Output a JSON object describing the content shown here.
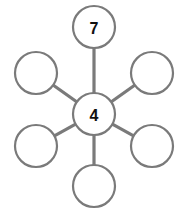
{
  "diagram": {
    "type": "hub-and-spoke",
    "title": "",
    "background_color": "#ffffff",
    "stroke_color": "#7a7a7a",
    "node_fill_color": "#ffffff",
    "label_color": "#111111",
    "stroke_width": 2.2,
    "spoke_width": 3.2,
    "canvas": {
      "width": 185,
      "height": 216
    },
    "center": {
      "id": "center",
      "label": "4",
      "cx": 94,
      "cy": 114,
      "r": 21,
      "filled": false,
      "has_label": true
    },
    "outer_nodes": [
      {
        "id": "top",
        "label": "7",
        "cx": 94,
        "cy": 27,
        "r": 21,
        "has_label": true
      },
      {
        "id": "upper-right",
        "label": "",
        "cx": 152,
        "cy": 73,
        "r": 21,
        "has_label": false
      },
      {
        "id": "lower-right",
        "label": "",
        "cx": 152,
        "cy": 146,
        "r": 21,
        "has_label": false
      },
      {
        "id": "bottom",
        "label": "",
        "cx": 94,
        "cy": 186,
        "r": 21,
        "has_label": false
      },
      {
        "id": "lower-left",
        "label": "",
        "cx": 36,
        "cy": 146,
        "r": 21,
        "has_label": false
      },
      {
        "id": "upper-left",
        "label": "",
        "cx": 36,
        "cy": 73,
        "r": 21,
        "has_label": false
      }
    ],
    "spokes": [
      {
        "id": "spoke-top",
        "from": "center",
        "to": "top"
      },
      {
        "id": "spoke-upper-right",
        "from": "center",
        "to": "upper-right"
      },
      {
        "id": "spoke-lower-right",
        "from": "center",
        "to": "lower-right"
      },
      {
        "id": "spoke-bottom",
        "from": "center",
        "to": "bottom"
      },
      {
        "id": "spoke-lower-left",
        "from": "center",
        "to": "lower-left"
      },
      {
        "id": "spoke-upper-left",
        "from": "center",
        "to": "upper-left"
      }
    ],
    "label_font_size": 16
  }
}
